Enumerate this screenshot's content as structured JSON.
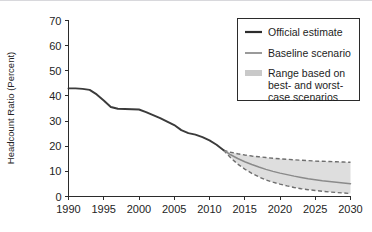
{
  "chart_data": {
    "type": "line",
    "title": "",
    "xlabel": "",
    "ylabel": "Headcount Ratio (Percent)",
    "xlim": [
      1990,
      2030
    ],
    "ylim": [
      0,
      70
    ],
    "ytick_values": [
      0,
      10,
      20,
      30,
      40,
      50,
      60,
      70
    ],
    "ytick_labels": [
      "0",
      "10",
      "20",
      "30",
      "40",
      "50",
      "60",
      "70"
    ],
    "xtick_values": [
      1990,
      1995,
      2000,
      2005,
      2010,
      2015,
      2020,
      2025,
      2030
    ],
    "xtick_labels": [
      "1990",
      "1995",
      "2000",
      "2005",
      "2010",
      "2015",
      "2020",
      "2025",
      "2030"
    ],
    "grid": false,
    "legend_position": "upper-right",
    "series": [
      {
        "name": "Official estimate",
        "color": "#3b3b3b",
        "style": "solid",
        "x": [
          1990,
          1991,
          1992,
          1993,
          1994,
          1995,
          1996,
          1997,
          1998,
          1999,
          2000,
          2001,
          2002,
          2003,
          2004,
          2005,
          2006,
          2007,
          2008,
          2009,
          2010,
          2011,
          2012
        ],
        "values": [
          43.0,
          43.0,
          42.8,
          42.4,
          40.6,
          38.2,
          35.6,
          34.9,
          34.8,
          34.7,
          34.6,
          33.6,
          32.4,
          31.2,
          29.8,
          28.4,
          26.4,
          25.2,
          24.6,
          23.6,
          22.3,
          20.6,
          18.4
        ]
      },
      {
        "name": "Baseline scenario",
        "color": "#8a8a8a",
        "style": "solid",
        "x": [
          2012,
          2013,
          2014,
          2015,
          2016,
          2017,
          2018,
          2019,
          2020,
          2021,
          2022,
          2023,
          2024,
          2025,
          2026,
          2027,
          2028,
          2029,
          2030
        ],
        "values": [
          18.4,
          16.6,
          15.1,
          13.8,
          12.7,
          11.7,
          10.8,
          10.0,
          9.3,
          8.7,
          8.1,
          7.6,
          7.1,
          6.7,
          6.3,
          6.0,
          5.7,
          5.4,
          5.1
        ]
      }
    ],
    "band": {
      "name": "Range based on best- and worst-case scenarios",
      "fill_color": "#c9c9c9",
      "edge_color": "#6e6e6e",
      "edge_style": "dashed",
      "x": [
        2012,
        2013,
        2014,
        2015,
        2016,
        2017,
        2018,
        2019,
        2020,
        2021,
        2022,
        2023,
        2024,
        2025,
        2026,
        2027,
        2028,
        2029,
        2030
      ],
      "upper": [
        18.4,
        17.6,
        17.0,
        16.5,
        16.1,
        15.8,
        15.5,
        15.2,
        15.0,
        14.8,
        14.6,
        14.4,
        14.3,
        14.1,
        14.0,
        13.9,
        13.8,
        13.7,
        13.6
      ],
      "lower": [
        18.4,
        15.4,
        12.9,
        10.9,
        9.2,
        7.8,
        6.6,
        5.7,
        4.9,
        4.2,
        3.6,
        3.1,
        2.7,
        2.4,
        2.1,
        1.8,
        1.6,
        1.4,
        1.2
      ]
    }
  },
  "legend": {
    "items": [
      {
        "label": "Official estimate",
        "swatch": "line-dark"
      },
      {
        "label": "Baseline scenario",
        "swatch": "line-gray"
      },
      {
        "label": "Range based on",
        "swatch": "patch-gray"
      },
      {
        "label": "best- and worst-",
        "swatch": "none"
      },
      {
        "label": "case scenarios",
        "swatch": "none"
      }
    ]
  }
}
